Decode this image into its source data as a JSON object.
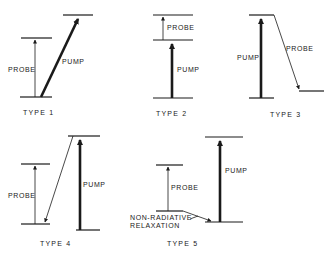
{
  "figure": {
    "panels": [
      {
        "id": "type1",
        "caption": "TYPE 1",
        "labels": {
          "probe": "PROBE",
          "pump": "PUMP"
        }
      },
      {
        "id": "type2",
        "caption": "TYPE 2",
        "labels": {
          "probe": "PROBE",
          "pump": "PUMP"
        }
      },
      {
        "id": "type3",
        "caption": "TYPE 3",
        "labels": {
          "probe": "PROBE",
          "pump": "PUMP"
        }
      },
      {
        "id": "type4",
        "caption": "TYPE 4",
        "labels": {
          "probe": "PROBE",
          "pump": "PUMP"
        }
      },
      {
        "id": "type5",
        "caption": "TYPE 5",
        "labels": {
          "probe": "PROBE",
          "pump": "PUMP",
          "relaxation_line1": "NON-RADIATIVE",
          "relaxation_line2": "RELAXATION"
        }
      }
    ]
  },
  "colors": {
    "ink": "#1a1a1a",
    "background": "#ffffff"
  }
}
